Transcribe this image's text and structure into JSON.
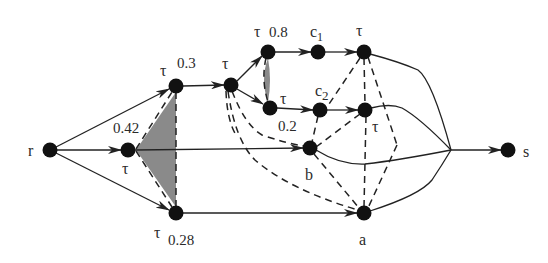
{
  "diagram": {
    "type": "directed-graph",
    "nodes": [
      {
        "id": "r",
        "label": "r",
        "x": 50,
        "y": 150
      },
      {
        "id": "t042",
        "label": "τ",
        "weight": "0.42",
        "x": 128,
        "y": 150
      },
      {
        "id": "t03",
        "label": "τ",
        "weight": "0.3",
        "x": 176,
        "y": 86
      },
      {
        "id": "t028",
        "label": "τ",
        "weight": "0.28",
        "x": 176,
        "y": 213
      },
      {
        "id": "tmid",
        "label": "τ",
        "x": 231,
        "y": 85
      },
      {
        "id": "t08",
        "label": "τ",
        "weight": "0.8",
        "x": 268,
        "y": 52
      },
      {
        "id": "t02",
        "label": "τ",
        "weight": "0.2",
        "x": 270,
        "y": 108
      },
      {
        "id": "c1",
        "label": "c1",
        "x": 318,
        "y": 52
      },
      {
        "id": "c2",
        "label": "c2",
        "x": 320,
        "y": 110
      },
      {
        "id": "tr1",
        "label": "τ",
        "x": 364,
        "y": 52
      },
      {
        "id": "tr2",
        "label": "τ",
        "x": 365,
        "y": 110
      },
      {
        "id": "b",
        "label": "b",
        "x": 310,
        "y": 148
      },
      {
        "id": "a",
        "label": "a",
        "x": 364,
        "y": 213
      },
      {
        "id": "s",
        "label": "s",
        "x": 508,
        "y": 150
      }
    ],
    "labels": {
      "r": "r",
      "s": "s",
      "a": "a",
      "b": "b",
      "tau": "τ",
      "c": "c",
      "c1_sub": "1",
      "c2_sub": "2",
      "w042": "0.42",
      "w03": "0.3",
      "w028": "0.28",
      "w08": "0.8",
      "w02": "0.2"
    },
    "solid_edges": [
      [
        "r",
        "t042"
      ],
      [
        "r",
        "t03"
      ],
      [
        "r",
        "t028"
      ],
      [
        "t03",
        "tmid"
      ],
      [
        "tmid",
        "t08"
      ],
      [
        "tmid",
        "t02"
      ],
      [
        "t08",
        "c1"
      ],
      [
        "c1",
        "tr1"
      ],
      [
        "t02",
        "c2"
      ],
      [
        "c2",
        "tr2"
      ],
      [
        "t042",
        "b"
      ],
      [
        "t028",
        "a"
      ],
      [
        "tr1",
        "junction"
      ],
      [
        "tr2",
        "junction"
      ],
      [
        "b",
        "junction"
      ],
      [
        "a",
        "junction"
      ],
      [
        "junction",
        "s"
      ]
    ],
    "dashed_edges": [
      [
        "t03",
        "t028"
      ],
      [
        "t042",
        "t03"
      ],
      [
        "t042",
        "t028"
      ],
      [
        "t08",
        "t02"
      ],
      [
        "tmid",
        "b"
      ],
      [
        "tmid",
        "a"
      ],
      [
        "c2",
        "b"
      ],
      [
        "tr2",
        "b"
      ],
      [
        "b",
        "a"
      ],
      [
        "tr1",
        "c2"
      ],
      [
        "tr1",
        "a"
      ],
      [
        "tr2",
        "a"
      ],
      [
        "tr1",
        "junction-dashed"
      ]
    ],
    "shaded_regions": [
      "triangle between τ(0.42), τ(0.3), τ(0.28)",
      "sliver between τ(0.8) and τ(0.2)"
    ]
  }
}
